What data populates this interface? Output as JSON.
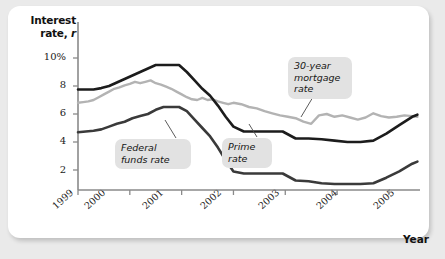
{
  "figure": {
    "background_color": "#eaeaea",
    "panel_color": "#ffffff"
  },
  "axis": {
    "y_title_line1": "Interest",
    "y_title_line2_pre": "rate, ",
    "y_title_line2_italic": "r",
    "x_title": "Year",
    "y_ticks": [
      "10%",
      "8",
      "6",
      "4",
      "2"
    ],
    "x_ticks": [
      "1999",
      "2000",
      "2001",
      "2002",
      "2003",
      "2004",
      "2005"
    ]
  },
  "callouts": [
    {
      "key": "mortgage",
      "text": "30-year\nmortgage\nrate"
    },
    {
      "key": "fedfunds",
      "text": "Federal\nfunds rate"
    },
    {
      "key": "prime",
      "text": "Prime\nrate"
    }
  ],
  "chart_data": {
    "type": "line",
    "title": "",
    "xlabel": "Year",
    "ylabel": "Interest rate, r",
    "xlim": [
      1999,
      2005.6
    ],
    "ylim": [
      0,
      11
    ],
    "grid": false,
    "legend": "inline-callouts",
    "y_tick_values": [
      10,
      8,
      6,
      4,
      2
    ],
    "y_tick_labels": [
      "10%",
      "8",
      "6",
      "4",
      "2"
    ],
    "x_tick_values": [
      1999,
      2000,
      2001,
      2002,
      2003,
      2004,
      2005
    ],
    "x_tick_labels": [
      "1999",
      "2000",
      "2001",
      "2002",
      "2003",
      "2004",
      "2005"
    ],
    "series": [
      {
        "name": "Prime rate",
        "color": "#1c1c1c",
        "width": 2.6,
        "x": [
          1999.0,
          1999.15,
          1999.3,
          1999.45,
          1999.6,
          1999.75,
          1999.9,
          2000.05,
          2000.2,
          2000.35,
          2000.5,
          2000.65,
          2000.8,
          2000.95,
          2001.1,
          2001.25,
          2001.4,
          2001.55,
          2001.7,
          2001.85,
          2002.0,
          2002.2,
          2002.45,
          2002.7,
          2002.95,
          2003.2,
          2003.45,
          2003.7,
          2003.95,
          2004.2,
          2004.45,
          2004.7,
          2004.95,
          2005.2,
          2005.45,
          2005.55
        ],
        "values": [
          7.75,
          7.75,
          7.75,
          7.85,
          8.0,
          8.25,
          8.5,
          8.75,
          9.0,
          9.25,
          9.5,
          9.5,
          9.5,
          9.5,
          9.0,
          8.4,
          7.8,
          7.3,
          6.6,
          5.8,
          5.1,
          4.75,
          4.75,
          4.75,
          4.75,
          4.25,
          4.25,
          4.2,
          4.1,
          4.0,
          4.0,
          4.1,
          4.6,
          5.2,
          5.8,
          5.95
        ]
      },
      {
        "name": "30-year mortgage rate",
        "color": "#b3b3b3",
        "width": 2.4,
        "x": [
          1999.0,
          1999.1,
          1999.2,
          1999.3,
          1999.4,
          1999.5,
          1999.6,
          1999.7,
          1999.8,
          1999.9,
          2000.0,
          2000.1,
          2000.2,
          2000.3,
          2000.4,
          2000.5,
          2000.6,
          2000.7,
          2000.8,
          2000.9,
          2001.0,
          2001.1,
          2001.2,
          2001.3,
          2001.4,
          2001.5,
          2001.6,
          2001.7,
          2001.8,
          2001.9,
          2002.0,
          2002.15,
          2002.3,
          2002.45,
          2002.6,
          2002.75,
          2002.9,
          2003.05,
          2003.2,
          2003.35,
          2003.5,
          2003.65,
          2003.8,
          2003.95,
          2004.1,
          2004.25,
          2004.4,
          2004.55,
          2004.7,
          2004.85,
          2005.0,
          2005.15,
          2005.3,
          2005.45,
          2005.55
        ],
        "values": [
          6.8,
          6.85,
          6.9,
          7.0,
          7.2,
          7.4,
          7.6,
          7.8,
          7.9,
          8.05,
          8.15,
          8.3,
          8.2,
          8.3,
          8.4,
          8.2,
          8.1,
          7.95,
          7.8,
          7.6,
          7.4,
          7.2,
          7.05,
          7.0,
          7.15,
          7.0,
          7.05,
          6.9,
          6.8,
          6.7,
          6.8,
          6.7,
          6.5,
          6.4,
          6.2,
          6.05,
          5.9,
          5.8,
          5.7,
          5.45,
          5.3,
          5.9,
          6.0,
          5.8,
          5.9,
          5.75,
          5.6,
          5.75,
          6.05,
          5.85,
          5.75,
          5.8,
          5.9,
          5.85,
          5.8
        ]
      },
      {
        "name": "Federal funds rate",
        "color": "#3a3a3a",
        "width": 2.6,
        "x": [
          1999.0,
          1999.15,
          1999.3,
          1999.45,
          1999.6,
          1999.75,
          1999.9,
          2000.05,
          2000.2,
          2000.35,
          2000.5,
          2000.65,
          2000.8,
          2000.95,
          2001.1,
          2001.25,
          2001.4,
          2001.55,
          2001.7,
          2001.85,
          2002.0,
          2002.2,
          2002.45,
          2002.7,
          2002.95,
          2003.2,
          2003.45,
          2003.7,
          2003.95,
          2004.2,
          2004.45,
          2004.7,
          2004.95,
          2005.2,
          2005.45,
          2005.55
        ],
        "values": [
          4.7,
          4.75,
          4.8,
          4.9,
          5.1,
          5.3,
          5.45,
          5.7,
          5.85,
          6.0,
          6.3,
          6.5,
          6.5,
          6.5,
          6.2,
          5.6,
          5.0,
          4.4,
          3.6,
          2.7,
          1.9,
          1.75,
          1.75,
          1.75,
          1.75,
          1.25,
          1.2,
          1.05,
          1.0,
          1.0,
          1.0,
          1.05,
          1.45,
          1.9,
          2.45,
          2.6
        ]
      }
    ]
  }
}
